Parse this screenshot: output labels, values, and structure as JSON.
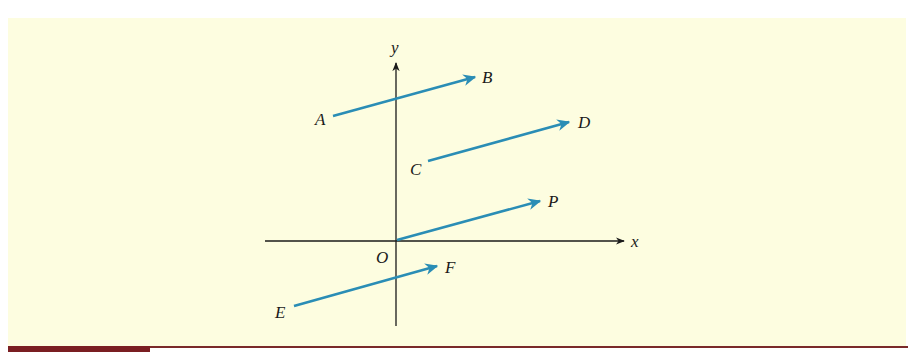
{
  "figure": {
    "background_color": "#fdfde0",
    "rule_color": "#7a2a2a",
    "vector_color": "#2a8db5",
    "axis_color": "#1a1a1a",
    "axes": {
      "x_label": "x",
      "y_label": "y",
      "origin_label": "O"
    },
    "vectors": [
      {
        "from_label": "A",
        "to_label": "B"
      },
      {
        "from_label": "C",
        "to_label": "D"
      },
      {
        "from_label": "O",
        "to_label": "P"
      },
      {
        "from_label": "E",
        "to_label": "F"
      }
    ]
  }
}
